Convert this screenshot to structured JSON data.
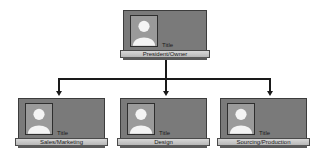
{
  "diagram": {
    "type": "org-chart",
    "root": {
      "title": "Title",
      "role": "President/Owner"
    },
    "children": [
      {
        "title": "Title",
        "role": "Sales/Marketing"
      },
      {
        "title": "Title",
        "role": "Design"
      },
      {
        "title": "Title",
        "role": "Sourcing/Production"
      }
    ],
    "colors": {
      "card": "#7a7a7a",
      "photo_bg": "#9a9a9a",
      "plate": "#c8c8c8",
      "connector": "#1a1a1a"
    }
  }
}
